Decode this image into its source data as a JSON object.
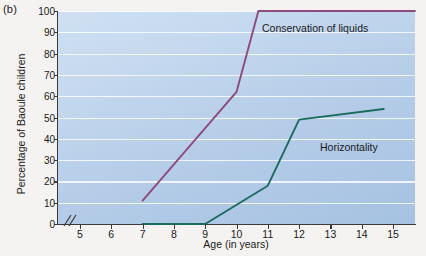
{
  "panel": {
    "label": "(b)"
  },
  "colors": {
    "conservation_line": "#8e4a7e",
    "horizontality_line": "#1d6b5e",
    "plot_bg_light": "#cfe0f2",
    "plot_bg_dark": "#a6c2e2",
    "gridline": "#ffffff",
    "axis": "#3a3a3a",
    "figure_bg": "#f4f3f1"
  },
  "chart_data": {
    "type": "line",
    "title": "",
    "subtitle": "",
    "xlabel": "Age (in years)",
    "ylabel": "Percentage of Baoule children",
    "xlim": [
      4.3,
      15.7
    ],
    "ylim": [
      0,
      100
    ],
    "xticks": [
      5,
      6,
      7,
      8,
      9,
      10,
      11,
      12,
      13,
      14,
      15
    ],
    "xtick_labels": [
      "5",
      "6",
      "7",
      "8",
      "9",
      "10",
      "11",
      "12",
      "13",
      "14",
      "15"
    ],
    "yticks": [
      0,
      10,
      20,
      30,
      40,
      50,
      60,
      70,
      80,
      90,
      100
    ],
    "ytick_labels": [
      "0",
      "10",
      "20",
      "30",
      "40",
      "50",
      "60",
      "70",
      "80",
      "90",
      "100"
    ],
    "grid": "horizontal",
    "x_axis_break": true,
    "legend_position": "inline-annotations",
    "annotations": [
      {
        "text": "Conservation of liquids",
        "x": 11.2,
        "y": 93
      },
      {
        "text": "Horizontality",
        "x": 13.1,
        "y": 38
      }
    ],
    "series": [
      {
        "name": "Conservation of liquids",
        "color": "#8e4a7e",
        "x": [
          7.0,
          10.0,
          10.7,
          15.7
        ],
        "values": [
          11,
          62,
          100,
          100
        ]
      },
      {
        "name": "Horizontality",
        "color": "#1d6b5e",
        "x": [
          7.0,
          9.0,
          11.0,
          12.0,
          14.7
        ],
        "values": [
          0,
          0,
          18,
          49,
          54
        ]
      }
    ]
  }
}
